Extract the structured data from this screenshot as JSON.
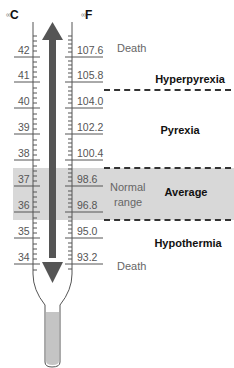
{
  "units": {
    "celsius": {
      "prefix": "∞",
      "label": "C"
    },
    "fahrenheit": {
      "prefix": "∞",
      "label": "F"
    }
  },
  "scale": [
    {
      "c": "42",
      "f": "107.6"
    },
    {
      "c": "41",
      "f": "105.8"
    },
    {
      "c": "40",
      "f": "104.0"
    },
    {
      "c": "39",
      "f": "102.2"
    },
    {
      "c": "38",
      "f": "100.4"
    },
    {
      "c": "37",
      "f": "98.6"
    },
    {
      "c": "36",
      "f": "96.8"
    },
    {
      "c": "35",
      "f": "95.0"
    },
    {
      "c": "34",
      "f": "93.2"
    }
  ],
  "zones": {
    "death_top": "Death",
    "hyperpyrexia": "Hyperpyrexia",
    "pyrexia": "Pyrexia",
    "normal_range_line1": "Normal",
    "normal_range_line2": "range",
    "average": "Average",
    "hypothermia": "Hypothermia",
    "death_bottom": "Death"
  },
  "colors": {
    "band": "#d8d8d8",
    "arrow": "#555555",
    "bulb": "#c4c4c4",
    "dashed": "#333333"
  }
}
